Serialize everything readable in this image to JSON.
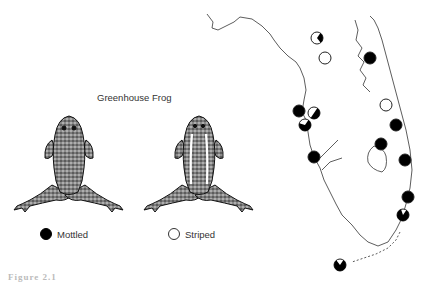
{
  "figure": {
    "title": "Greenhouse Frog",
    "caption_fragment": "Figure 2.1",
    "colors": {
      "mottled": "#000000",
      "striped": "#ffffff",
      "ink": "#333333"
    }
  },
  "frogs": [
    {
      "id": "mottled",
      "morph": "mottled",
      "label": "Mottled",
      "marker": "black-filled-circle"
    },
    {
      "id": "striped",
      "morph": "striped",
      "label": "Striped",
      "marker": "open-circle"
    }
  ],
  "legend": {
    "items": [
      {
        "label": "Mottled",
        "symbol": "filled-circle"
      },
      {
        "label": "Striped",
        "symbol": "open-circle"
      }
    ]
  },
  "map": {
    "region": "Florida peninsula",
    "sites": [
      {
        "x": 317,
        "y": 38,
        "mottled_fraction": 0.3,
        "type": "mixed"
      },
      {
        "x": 325,
        "y": 58,
        "mottled_fraction": 0.0,
        "type": "striped"
      },
      {
        "x": 370,
        "y": 58,
        "mottled_fraction": 1.0,
        "type": "mottled"
      },
      {
        "x": 299,
        "y": 111,
        "mottled_fraction": 1.0,
        "type": "mottled"
      },
      {
        "x": 314,
        "y": 113,
        "mottled_fraction": 0.5,
        "type": "mixed"
      },
      {
        "x": 305,
        "y": 125,
        "mottled_fraction": 0.7,
        "type": "mixed"
      },
      {
        "x": 386,
        "y": 105,
        "mottled_fraction": 0.0,
        "type": "striped"
      },
      {
        "x": 396,
        "y": 125,
        "mottled_fraction": 1.0,
        "type": "mottled"
      },
      {
        "x": 314,
        "y": 157,
        "mottled_fraction": 1.0,
        "type": "mottled"
      },
      {
        "x": 381,
        "y": 144,
        "mottled_fraction": 1.0,
        "type": "mottled"
      },
      {
        "x": 405,
        "y": 160,
        "mottled_fraction": 1.0,
        "type": "mottled"
      },
      {
        "x": 408,
        "y": 197,
        "mottled_fraction": 1.0,
        "type": "mottled"
      },
      {
        "x": 403,
        "y": 215,
        "mottled_fraction": 0.85,
        "type": "mixed"
      },
      {
        "x": 340,
        "y": 265,
        "mottled_fraction": 0.8,
        "type": "mixed"
      }
    ]
  }
}
